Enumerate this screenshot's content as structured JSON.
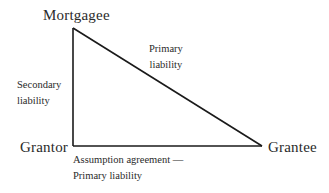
{
  "diagram": {
    "type": "triangle-relationship",
    "nodes": {
      "mortgagee": "Mortgagee",
      "grantor": "Grantor",
      "grantee": "Grantee"
    },
    "edges": {
      "mortgagee_grantor": {
        "line1": "Secondary",
        "line2": "liability"
      },
      "mortgagee_grantee": {
        "line1": "Primary",
        "line2": "liability"
      },
      "grantor_grantee": {
        "line1": "Assumption agreement —",
        "line2": "Primary liability"
      }
    },
    "colors": {
      "line": "#1a1a1a",
      "text": "#2a2a2a",
      "background": "#ffffff"
    }
  }
}
